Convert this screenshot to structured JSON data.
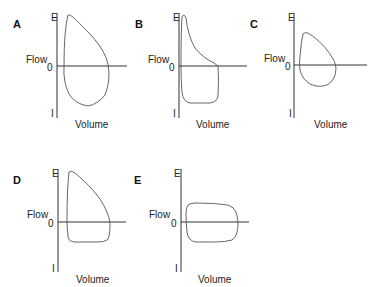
{
  "figure": {
    "axis_labels": {
      "y_top": "E",
      "y_bottom": "I",
      "y_name": "Flow",
      "y_zero": "0",
      "x_name": "Volume"
    },
    "panels": [
      {
        "id": "A",
        "label": "A",
        "shape": "normal flow-volume loop: rounded expiratory peak, rounded inspiratory curve"
      },
      {
        "id": "B",
        "label": "B",
        "shape": "sharp early expiratory peak with concave (scooped) decline; flattened inspiratory limb"
      },
      {
        "id": "C",
        "label": "C",
        "shape": "small, reduced-volume loop with proportionally reduced flows"
      },
      {
        "id": "D",
        "label": "D",
        "shape": "normal expiratory limb with flattened inspiratory limb"
      },
      {
        "id": "E",
        "label": "E",
        "shape": "flattened (plateaued) expiratory and inspiratory limbs"
      }
    ]
  }
}
